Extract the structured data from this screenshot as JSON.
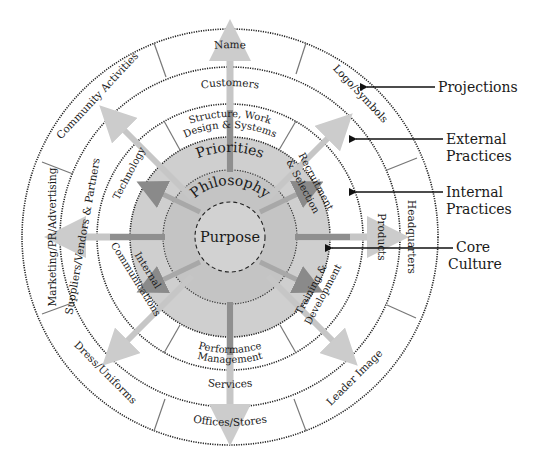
{
  "geometry": {
    "cx": 230,
    "cy": 237,
    "r_purpose": 35,
    "r_philosophy": 67,
    "r_core": 100,
    "r_internal": 133,
    "r_external": 170,
    "r_projections": 208
  },
  "colors": {
    "core_outer": "#cfcfcf",
    "core_mid": "#c2c2c2",
    "core_inner": "#d0d0d0",
    "ring_line": "#222222",
    "arrow_dark": "#8a8a8a",
    "arrow_light": "#c8c8c8",
    "divider": "#777777"
  },
  "rings": {
    "core": {
      "purpose": "Purpose",
      "philosophy": "Philosophy",
      "priorities": "Priorities"
    },
    "internal": [
      {
        "label": "Structure, Work",
        "label2": "Design & Systems"
      },
      {
        "label": "Recruitment",
        "label2": "& Selection"
      },
      {
        "label": "Training &",
        "label2": "Development"
      },
      {
        "label": "Performance",
        "label2": "Management"
      },
      {
        "label": "Internal",
        "label2": "Communications"
      },
      {
        "label": "Technology",
        "label2": ""
      }
    ],
    "external": [
      {
        "label": "Customers"
      },
      {
        "label": "Products"
      },
      {
        "label": "Services"
      },
      {
        "label": "Suppliers/Vendors & Partners"
      }
    ],
    "projections": [
      {
        "label": "Name"
      },
      {
        "label": "Logo/Symbols"
      },
      {
        "label": "Headquarters"
      },
      {
        "label": "Leader Image"
      },
      {
        "label": "Offices/Stores"
      },
      {
        "label": "Dress/Uniforms"
      },
      {
        "label": "Marketing/PR/Advertising"
      },
      {
        "label": "Community Activities"
      }
    ]
  },
  "callouts": [
    {
      "label": "Projections",
      "label2": ""
    },
    {
      "label": "External",
      "label2": "Practices"
    },
    {
      "label": "Internal",
      "label2": "Practices"
    },
    {
      "label": "Core",
      "label2": "Culture"
    }
  ]
}
